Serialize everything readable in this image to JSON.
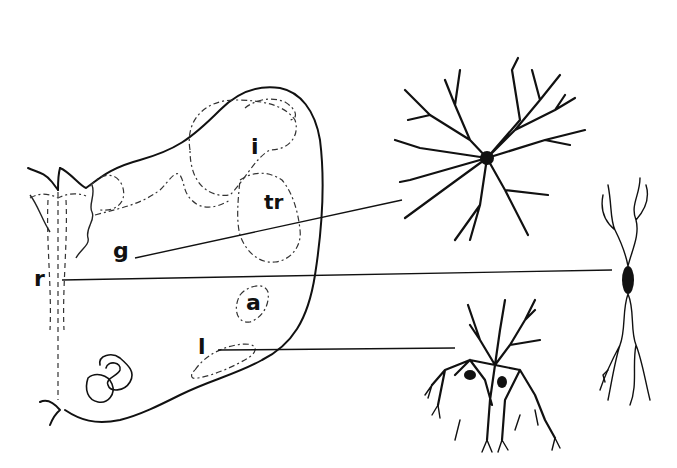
{
  "figure": {
    "type": "anatomical line drawing with neuron illustrations",
    "labels": {
      "i": "i",
      "tr": "tr",
      "g": "g",
      "r": "r",
      "a": "a",
      "l": "l"
    },
    "leader_lines": [
      {
        "from": "g",
        "to": "multipolar-neuron-top"
      },
      {
        "from": "r",
        "to": "bipolar-neuron-right"
      },
      {
        "from": "l",
        "to": "neuron-bottom"
      }
    ],
    "colors": {
      "ink": "#111111",
      "background": "#ffffff"
    }
  }
}
